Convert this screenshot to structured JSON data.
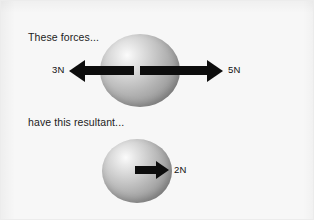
{
  "figure": {
    "background_color": "#f7f7f7",
    "border_color": "#ececec",
    "ink_color": "#0d0d0d",
    "text_color": "#1c1c1c",
    "width": 314,
    "height": 220
  },
  "top_panel": {
    "caption": "These forces...",
    "object": "sphere",
    "forces": [
      {
        "label": "3N",
        "magnitude": 3,
        "unit": "N",
        "direction": "left",
        "arrow_icon": "arrow-left-icon"
      },
      {
        "label": "5N",
        "magnitude": 5,
        "unit": "N",
        "direction": "right",
        "arrow_icon": "arrow-right-icon"
      }
    ]
  },
  "bottom_panel": {
    "caption": "have this resultant...",
    "object": "sphere",
    "forces": [
      {
        "label": "2N",
        "magnitude": 2,
        "unit": "N",
        "direction": "right",
        "arrow_icon": "arrow-right-icon"
      }
    ]
  }
}
